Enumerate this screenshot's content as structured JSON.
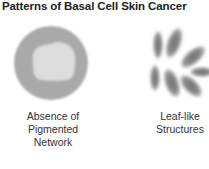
{
  "title": "Patterns of Basal Cell Skin Cancer",
  "patterns": [
    {
      "name": "absence-of-pigmented-network",
      "label_lines": [
        "Absence of",
        "Pigmented",
        "Network"
      ]
    },
    {
      "name": "leaf-like-structures",
      "label_lines": [
        "Leaf-like",
        "Structures"
      ]
    }
  ],
  "colors": {
    "circle": "#a9a9a9",
    "blob": "#dcdcdc",
    "leaf": "#8a8a8a"
  }
}
